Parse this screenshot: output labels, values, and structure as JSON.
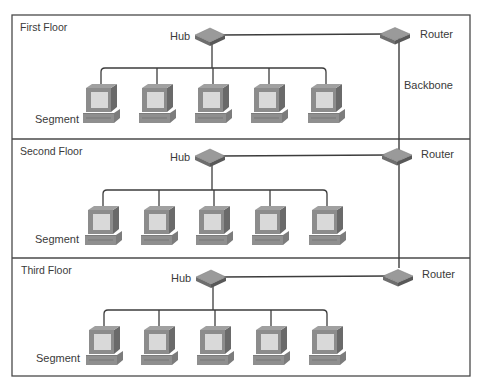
{
  "diagram": {
    "type": "network-topology",
    "frame": {
      "left": 12,
      "top": 15,
      "right": 470,
      "bottom": 376,
      "border_color": "#4a4a4a"
    },
    "backbone": {
      "label": "Backbone",
      "x": 399,
      "y_top": 34,
      "y_bottom": 268
    },
    "colors": {
      "line": "#3c3c3c",
      "device_top": "#9a9a9a",
      "device_side": "#6e6e6e",
      "monitor_body": "#8c8c8c",
      "monitor_screen": "#d9d9d9",
      "label_text": "#3a3a3a"
    },
    "floors": [
      {
        "title": "First Floor",
        "top": 15,
        "bottom": 139,
        "hub": {
          "label": "Hub",
          "cx": 210,
          "cy": 35
        },
        "router": {
          "label": "Router",
          "cx": 395,
          "cy": 34
        },
        "bus_y": 68,
        "segment_label": "Segment",
        "computers": [
          {
            "name": "PC 1",
            "x": 101
          },
          {
            "name": "PC 2",
            "x": 157
          },
          {
            "name": "PC 3",
            "x": 213
          },
          {
            "name": "PC 4",
            "x": 269
          },
          {
            "name": "PC 5",
            "x": 326
          }
        ]
      },
      {
        "title": "Second Floor",
        "top": 139,
        "bottom": 258,
        "hub": {
          "label": "Hub",
          "cx": 210,
          "cy": 156
        },
        "router": {
          "label": "Router",
          "cx": 397,
          "cy": 155
        },
        "bus_y": 190,
        "segment_label": "Segment",
        "computers": [
          {
            "name": "PC 1",
            "x": 103
          },
          {
            "name": "PC 2",
            "x": 159
          },
          {
            "name": "PC 3",
            "x": 214
          },
          {
            "name": "PC 4",
            "x": 270
          },
          {
            "name": "PC 5",
            "x": 327
          }
        ]
      },
      {
        "title": "Third Floor",
        "top": 258,
        "bottom": 376,
        "hub": {
          "label": "Hub",
          "cx": 211,
          "cy": 277
        },
        "router": {
          "label": "Router",
          "cx": 398,
          "cy": 276
        },
        "bus_y": 310,
        "segment_label": "Segment",
        "computers": [
          {
            "name": "PC 1",
            "x": 104
          },
          {
            "name": "PC 2",
            "x": 159
          },
          {
            "name": "PC 3",
            "x": 215
          },
          {
            "name": "PC 4",
            "x": 271
          },
          {
            "name": "PC 5",
            "x": 327
          }
        ]
      }
    ]
  }
}
